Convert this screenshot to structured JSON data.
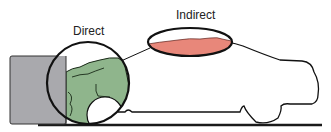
{
  "diagram": {
    "labels": {
      "direct": "Direct",
      "indirect": "Indirect"
    },
    "colors": {
      "wall": "#a9a9ad",
      "direct_damage": "#8fb58c",
      "indirect_damage": "#e8877a",
      "outline": "#111111",
      "ground": "#1a1a1a",
      "background": "#ffffff"
    },
    "elements": [
      {
        "name": "barrier-wall",
        "description": "gray rectangular barrier"
      },
      {
        "name": "vehicle-outline",
        "description": "car silhouette outline"
      },
      {
        "name": "direct-damage-zone",
        "description": "green crushed front-end area circled"
      },
      {
        "name": "indirect-damage-zone",
        "description": "red roof buckling area circled"
      },
      {
        "name": "ground-line",
        "description": "road surface"
      }
    ]
  }
}
